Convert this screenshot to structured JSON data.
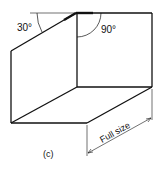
{
  "labels": {
    "angle_left": "30°",
    "angle_right": "90°",
    "dimension": "Full size",
    "caption": "(c)"
  },
  "colors": {
    "stroke": "#111111",
    "background": "#ffffff"
  }
}
